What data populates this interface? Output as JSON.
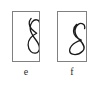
{
  "figure": {
    "type": "two-panel-curve-figure",
    "background_color": "#ffffff",
    "border_color": "#808080",
    "stroke_color": "#1a1a1a",
    "panels": [
      {
        "id": "e",
        "caption": "e",
        "curve_name": "figure-eight-narrow-crossing-curve",
        "description": "tall narrow figure-eight with small upper loop and larger lower loop, self-crossing near middle",
        "path": "M 19.5 6 C 16.5 9.5 17 14.5 20 17.5 C 23 20.5 25.5 22 25.5 22 C 25.5 22 21 24 18.5 27.5 C 15.5 31.5 15.5 38 19 41.5 C 22 44.5 26.5 44 28 40.5 C 29.5 37 27.5 33 24.5 29 C 21.5 25 18.5 21 18.5 16.5 C 18.5 11 22 7 25.5 7.5 C 27.5 7.8 28.5 9 28.5 10.5"
      },
      {
        "id": "f",
        "caption": "f",
        "curve_name": "figure-eight-round-loop-curve",
        "description": "rounded upper loop over a wider flatter lower loop, self-crossing near middle",
        "path": "M 20 12.5 C 16 16 15.5 22 19 25.5 C 22 28.5 25 29.5 25 29.5 C 25 29.5 18 31.5 14.5 35.5 C 11.5 39 11.8 43.5 15.5 44.5 C 19 45.5 23.5 44 26.5 41 C 29.5 38 27 33 23 29 C 19.5 25.5 17.5 21.5 18.5 17.5 C 19.5 13 23.5 10.5 26.5 12 C 28.5 13 29 15 28.5 17"
      }
    ]
  }
}
